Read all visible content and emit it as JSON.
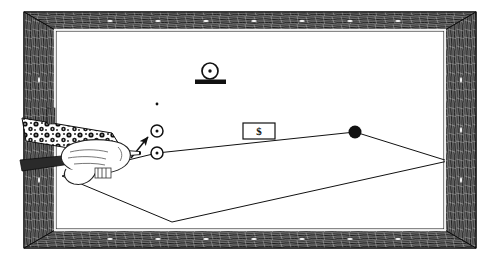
{
  "illustration": {
    "title": "Billiard Table Trick Shot Diagram",
    "style": "black-and-white line art engraving",
    "background_color": "#ffffff",
    "ink_color": "#1a1a1a"
  },
  "table": {
    "label": "billiard-table",
    "frame": {
      "label": "wooden-frame",
      "texture": "woodgrain",
      "color": "#3a3a3a",
      "outer": {
        "x": 24,
        "y": 12,
        "width": 452,
        "height": 236
      },
      "inner": {
        "x": 55,
        "y": 30,
        "width": 390,
        "height": 200
      },
      "rail_width": 31,
      "inlay_dots": [
        {
          "x": 110,
          "y": 21
        },
        {
          "x": 158,
          "y": 21
        },
        {
          "x": 206,
          "y": 21
        },
        {
          "x": 254,
          "y": 21
        },
        {
          "x": 302,
          "y": 21
        },
        {
          "x": 350,
          "y": 21
        },
        {
          "x": 398,
          "y": 21
        },
        {
          "x": 110,
          "y": 239
        },
        {
          "x": 158,
          "y": 239
        },
        {
          "x": 206,
          "y": 239
        },
        {
          "x": 254,
          "y": 239
        },
        {
          "x": 302,
          "y": 239
        },
        {
          "x": 350,
          "y": 239
        },
        {
          "x": 398,
          "y": 239
        },
        {
          "x": 39,
          "y": 80
        },
        {
          "x": 39,
          "y": 130
        },
        {
          "x": 39,
          "y": 180
        },
        {
          "x": 461,
          "y": 80
        },
        {
          "x": 461,
          "y": 130
        },
        {
          "x": 461,
          "y": 180
        }
      ]
    },
    "cloth": {
      "label": "table-cloth-surface",
      "color": "#ffffff",
      "rect": {
        "x": 55,
        "y": 30,
        "width": 390,
        "height": 200
      }
    }
  },
  "balls": [
    {
      "name": "cue-ball",
      "type": "ring-with-dot",
      "cx": 157,
      "cy": 153,
      "r": 6.0,
      "fill": "#ffffff",
      "stroke": "#111111"
    },
    {
      "name": "object-ball-upper",
      "type": "ring-with-dot",
      "cx": 157,
      "cy": 131,
      "r": 6.0,
      "fill": "#ffffff",
      "stroke": "#111111"
    },
    {
      "name": "eight-ball",
      "type": "solid",
      "cx": 355,
      "cy": 132,
      "r": 6.5,
      "fill": "#111111",
      "stroke": "#111111"
    }
  ],
  "markers": [
    {
      "name": "spot-marker",
      "cx": 157,
      "cy": 104,
      "r": 1.3,
      "fill": "#111111"
    }
  ],
  "coin_stand": {
    "name": "coin-on-stand",
    "coin": {
      "cx": 210,
      "cy": 71,
      "r": 8.0,
      "dot_r": 1.6,
      "stroke": "#111111",
      "fill": "#ffffff"
    },
    "base": {
      "x": 195,
      "y": 81,
      "width": 31,
      "height": 4.5,
      "fill": "#111111"
    }
  },
  "money_card": {
    "name": "dollar-bill-card",
    "label": "$",
    "rect": {
      "x": 243,
      "y": 123,
      "width": 32,
      "height": 16
    },
    "stroke": "#111111",
    "fill": "#ffffff"
  },
  "cue": {
    "name": "cue-stick",
    "tip": {
      "x": 134,
      "y": 153
    },
    "butt": {
      "x": 22,
      "y": 166
    },
    "ferrule_color": "#ffffff",
    "shaft_color": "#2a2a2a"
  },
  "arm": {
    "name": "players-arm",
    "sleeve_pattern": "floral-dotted",
    "sleeve_color": "#1c1c1c",
    "hand_color": "#ffffff",
    "hand_outline": "#222222"
  },
  "trajectory": {
    "name": "shot-path-lines",
    "stroke": "#111111",
    "stroke_width": 1.0,
    "segments": [
      {
        "name": "cue-to-eight-ball",
        "points": [
          [
            157,
            153
          ],
          [
            355,
            132
          ]
        ]
      },
      {
        "name": "eight-to-right-cushion",
        "points": [
          [
            355,
            132
          ],
          [
            448,
            161
          ]
        ]
      },
      {
        "name": "right-cushion-to-bottom",
        "points": [
          [
            448,
            161
          ],
          [
            172,
            222
          ]
        ]
      },
      {
        "name": "bottom-to-left-cushion",
        "points": [
          [
            172,
            222
          ],
          [
            62,
            176
          ]
        ]
      },
      {
        "name": "left-cushion-to-cue",
        "points": [
          [
            62,
            176
          ],
          [
            157,
            153
          ]
        ]
      }
    ],
    "aim_arrow": {
      "name": "aim-direction-arrow",
      "from": [
        132,
        157
      ],
      "to": [
        150,
        136
      ]
    }
  }
}
